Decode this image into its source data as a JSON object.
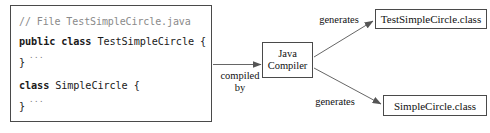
{
  "diagram": {
    "colors": {
      "border": "#4a4a4a",
      "text": "#111111",
      "comment": "#8a8a8a",
      "background": "#ffffff",
      "arrow": "#555555"
    }
  },
  "code_box": {
    "comment_line": "// File TestSimpleCircle.java",
    "line_public_keywords": "public class ",
    "line_public_identifier": "TestSimpleCircle {",
    "ellipsis_1": "...",
    "closing_brace_1": "}",
    "line_class_keyword": "class ",
    "line_class_identifier": "SimpleCircle {",
    "ellipsis_2": "...",
    "closing_brace_2": "}"
  },
  "compiler": {
    "line1": "Java",
    "line2": "Compiler"
  },
  "edges": {
    "compiled_by": "compiled\nby",
    "generates_top": "generates",
    "generates_bottom": "generates"
  },
  "outputs": {
    "top_class_file": "TestSimpleCircle.class",
    "bottom_class_file": "SimpleCircle.class"
  }
}
